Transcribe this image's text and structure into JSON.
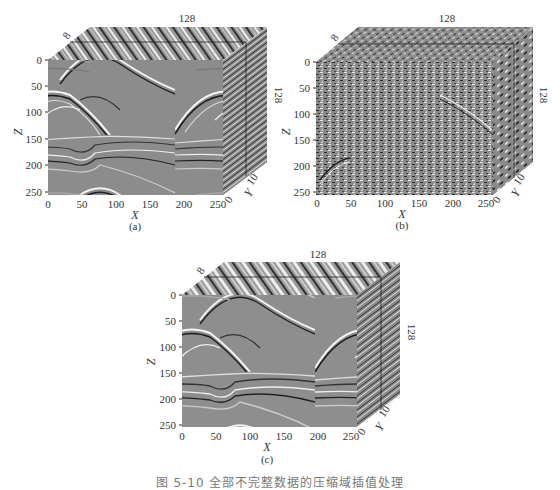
{
  "figure": {
    "caption": "图 5-10  全部不完整数据的压缩域插值处理",
    "panels": [
      {
        "id": "a",
        "label": "(a)",
        "description": "Original 3D seismic volume",
        "x_axis_label": "X",
        "z_axis_label": "Z",
        "y_axis_label": "Y",
        "x_ticks": [
          "0",
          "50",
          "100",
          "150",
          "200",
          "250"
        ],
        "z_ticks": [
          "0",
          "50",
          "100",
          "150",
          "200",
          "250"
        ],
        "y_ticks": [
          "0",
          "10"
        ],
        "top_label_x": "128",
        "top_label_y": "8",
        "side_label": "128"
      },
      {
        "id": "b",
        "label": "(b)",
        "description": "Incomplete / noisy 3D seismic volume",
        "x_axis_label": "X",
        "z_axis_label": "Z",
        "y_axis_label": "Y",
        "x_ticks": [
          "0",
          "50",
          "100",
          "150",
          "200",
          "250"
        ],
        "z_ticks": [
          "0",
          "50",
          "100",
          "150",
          "200",
          "250"
        ],
        "y_ticks": [
          "0",
          "10"
        ],
        "top_label_x": "128",
        "top_label_y": "8",
        "side_label": "128"
      },
      {
        "id": "c",
        "label": "(c)",
        "description": "Reconstructed 3D seismic volume",
        "x_axis_label": "X",
        "z_axis_label": "Z",
        "y_axis_label": "Y",
        "x_ticks": [
          "0",
          "50",
          "100",
          "150",
          "200",
          "250"
        ],
        "z_ticks": [
          "0",
          "50",
          "100",
          "150",
          "200",
          "250"
        ],
        "y_ticks": [
          "0",
          "10"
        ],
        "top_label_x": "128",
        "top_label_y": "8",
        "side_label": "128"
      }
    ]
  },
  "colors": {
    "background": "#ffffff",
    "volume_gray": "#8a8a8a",
    "axis_text": "#333333",
    "frame_line": "#222222"
  }
}
